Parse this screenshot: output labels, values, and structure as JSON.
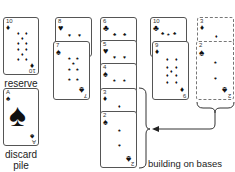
{
  "labels": {
    "reserve": "reserve",
    "discard_line1": "discard",
    "discard_line2": "pile",
    "building": "building on bases"
  },
  "reserve_card": {
    "rank": "10",
    "suit": "diamond",
    "glyph": "♦"
  },
  "discard_card": {
    "rank": "A",
    "suit": "spade",
    "glyph": "♠"
  },
  "columns": [
    {
      "cards": [
        {
          "rank": "8",
          "suit": "heart",
          "glyph": "♥"
        },
        {
          "rank": "7",
          "suit": "spade",
          "glyph": "♠"
        }
      ]
    },
    {
      "cards": [
        {
          "rank": "6",
          "suit": "club",
          "glyph": "♣"
        },
        {
          "rank": "5",
          "suit": "heart",
          "glyph": "♥"
        },
        {
          "rank": "4",
          "suit": "spade",
          "glyph": "♠"
        },
        {
          "rank": "3",
          "suit": "diamond",
          "glyph": "♦"
        },
        {
          "rank": "2",
          "suit": "spade",
          "glyph": "♠"
        }
      ]
    },
    {
      "cards": [
        {
          "rank": "10",
          "suit": "club",
          "glyph": "♣"
        },
        {
          "rank": "9",
          "suit": "diamond",
          "glyph": "♦"
        }
      ]
    },
    {
      "style": "dashed",
      "cards": [
        {
          "rank": "3",
          "suit": "diamond",
          "glyph": "♦"
        },
        {
          "rank": "2",
          "suit": "spade",
          "glyph": "♠"
        }
      ]
    }
  ]
}
